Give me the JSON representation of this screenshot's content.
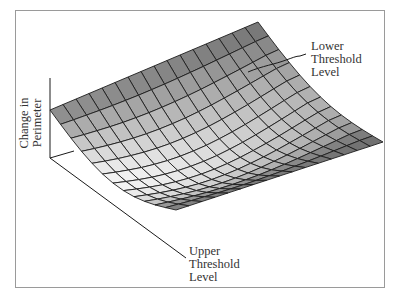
{
  "figure": {
    "frame_color": "#9a9a9a",
    "line_color": "#1a1a1a"
  },
  "labels": {
    "z_axis": [
      "Change in",
      "Perimeter"
    ],
    "lower_threshold": [
      "Lower",
      "Threshold",
      "Level"
    ],
    "upper_threshold": [
      "Upper",
      "Threshold",
      "Level"
    ]
  },
  "surface": {
    "grid_u": 12,
    "grid_v": 16,
    "corners": {
      "left": [
        50,
        110
      ],
      "back": [
        258,
        22
      ],
      "right": [
        383,
        142
      ],
      "front": [
        176,
        210
      ]
    },
    "sag": 42,
    "shade_dark": "#5a5a5a",
    "shade_light": "#f4f4f4"
  },
  "axes": {
    "vertical": [
      [
        50,
        78
      ],
      [
        50,
        158
      ]
    ],
    "upper_axis": [
      [
        50,
        158
      ],
      [
        186,
        258
      ]
    ],
    "back_axis": [
      [
        50,
        158
      ],
      [
        74,
        151
      ]
    ]
  }
}
